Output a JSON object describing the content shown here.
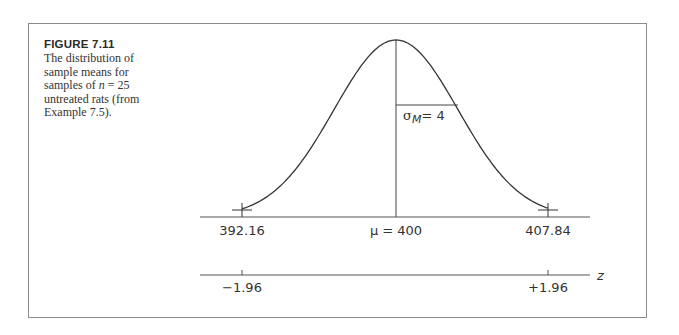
{
  "figure": {
    "title": "FIGURE 7.11",
    "caption_parts": {
      "before_n": "The distribution of sample means for samples of ",
      "n_symbol": "n",
      "after_n": " = 25 untreated rats (from Example 7.5)."
    }
  },
  "chart_data": {
    "type": "line",
    "title": "The distribution of sample means for samples of n = 25 untreated rats",
    "mean_label": "μ = 400",
    "mean": 400,
    "std_error": 4,
    "std_error_label": "σ_M = 4",
    "sigma_symbol": "σ",
    "sigma_subscript": "M",
    "sigma_value_text": "= 4",
    "x_axis": {
      "ticks": [
        {
          "value": 392.16,
          "label": "392.16"
        },
        {
          "value": 400,
          "label": "μ = 400"
        },
        {
          "value": 407.84,
          "label": "407.84"
        }
      ]
    },
    "z_axis": {
      "label": "z",
      "ticks": [
        {
          "value": -1.96,
          "label": "−1.96"
        },
        {
          "value": 1.96,
          "label": "+1.96"
        }
      ]
    },
    "grid": false,
    "legend": null
  }
}
